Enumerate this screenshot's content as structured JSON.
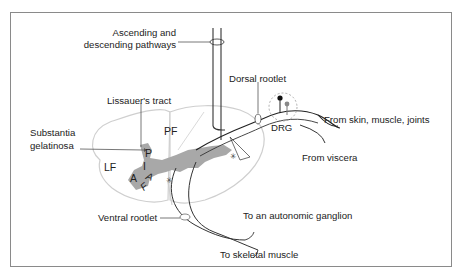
{
  "figure": {
    "labels": {
      "ascending": "Ascending and",
      "descending": "descending pathways",
      "dorsal_rootlet": "Dorsal rootlet",
      "lissauer": "Lissauer's tract",
      "substantia_1": "Substantia",
      "substantia_2": "gelatinosa",
      "pf": "PF",
      "lf": "LF",
      "p": "P",
      "i": "I",
      "a": "A",
      "af_a": "A",
      "af_f": "F",
      "drg": "DRG",
      "from_skin": "From skin, muscle, joints",
      "from_viscera": "From viscera",
      "ventral_rootlet": "Ventral rootlet",
      "to_autonomic": "To an autonomic ganglion",
      "to_skeletal": "To skeletal muscle"
    },
    "colors": {
      "gray_matter": "#a8a8a8",
      "line": "#333333",
      "border": "#888888",
      "outline": "#cfcfcf"
    }
  }
}
